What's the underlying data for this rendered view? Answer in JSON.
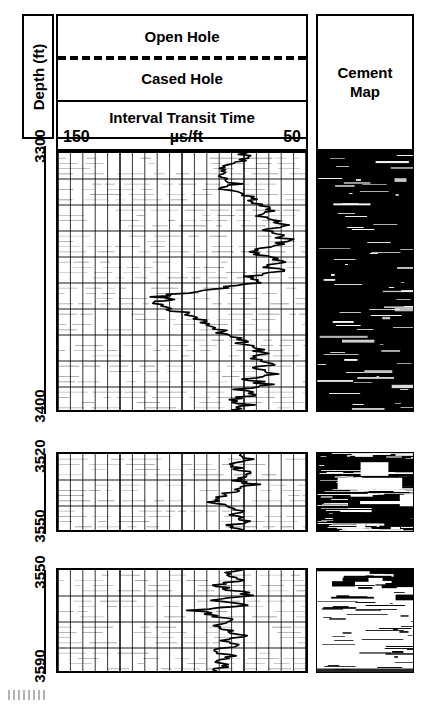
{
  "figure": {
    "type": "well-log",
    "depth_axis_label": "Depth (ft)"
  },
  "header": {
    "open_hole": "Open Hole",
    "cased_hole": "Cased Hole",
    "track_title": "Interval Transit Time",
    "scale_left": "150",
    "scale_unit": "µs/ft",
    "scale_right": "50",
    "cement_map_line1": "Cement",
    "cement_map_line2": "Map"
  },
  "chart_data": {
    "type": "line",
    "title": "Interval Transit Time",
    "xlabel": "µs/ft",
    "ylabel": "Depth (ft)",
    "xlim": [
      150,
      50
    ],
    "grid": true,
    "legend": "none",
    "x_axis_reversed": true,
    "panels": [
      {
        "name": "panel-1",
        "depth_top": 3300,
        "depth_bottom": 3400,
        "depth_ticks": [
          "3300",
          "3400"
        ],
        "series": [
          {
            "name": "Interval Transit Time",
            "points": [
              [
                3300,
                76
              ],
              [
                3302,
                73
              ],
              [
                3304,
                79
              ],
              [
                3306,
                84
              ],
              [
                3308,
                80
              ],
              [
                3310,
                85
              ],
              [
                3312,
                79
              ],
              [
                3314,
                83
              ],
              [
                3316,
                76
              ],
              [
                3318,
                72
              ],
              [
                3320,
                68
              ],
              [
                3322,
                64
              ],
              [
                3324,
                69
              ],
              [
                3326,
                63
              ],
              [
                3328,
                59
              ],
              [
                3330,
                66
              ],
              [
                3332,
                61
              ],
              [
                3334,
                57
              ],
              [
                3336,
                63
              ],
              [
                3338,
                72
              ],
              [
                3340,
                67
              ],
              [
                3342,
                59
              ],
              [
                3344,
                66
              ],
              [
                3346,
                58
              ],
              [
                3348,
                75
              ],
              [
                3350,
                68
              ],
              [
                3352,
                80
              ],
              [
                3354,
                97
              ],
              [
                3356,
                110
              ],
              [
                3357,
                104
              ],
              [
                3358,
                113
              ],
              [
                3360,
                106
              ],
              [
                3362,
                100
              ],
              [
                3364,
                95
              ],
              [
                3366,
                90
              ],
              [
                3368,
                86
              ],
              [
                3370,
                83
              ],
              [
                3372,
                79
              ],
              [
                3374,
                76
              ],
              [
                3376,
                71
              ],
              [
                3378,
                67
              ],
              [
                3380,
                73
              ],
              [
                3382,
                64
              ],
              [
                3384,
                70
              ],
              [
                3386,
                62
              ],
              [
                3388,
                74
              ],
              [
                3390,
                66
              ],
              [
                3392,
                78
              ],
              [
                3394,
                70
              ],
              [
                3396,
                82
              ],
              [
                3398,
                74
              ],
              [
                3400,
                80
              ]
            ]
          }
        ],
        "cement_map": {
          "dominant": "black",
          "description": "Mostly dark (good bond) with scattered thin white horizontal streaks"
        }
      },
      {
        "name": "panel-2",
        "depth_top": 3520,
        "depth_bottom": 3550,
        "depth_ticks": [
          "3520",
          "3550"
        ],
        "series": [
          {
            "name": "Interval Transit Time",
            "points": [
              [
                3520,
                78
              ],
              [
                3522,
                74
              ],
              [
                3524,
                80
              ],
              [
                3526,
                76
              ],
              [
                3528,
                72
              ],
              [
                3530,
                79
              ],
              [
                3532,
                71
              ],
              [
                3534,
                77
              ],
              [
                3536,
                84
              ],
              [
                3538,
                90
              ],
              [
                3540,
                83
              ],
              [
                3542,
                77
              ],
              [
                3544,
                81
              ],
              [
                3546,
                74
              ],
              [
                3548,
                79
              ],
              [
                3550,
                75
              ]
            ]
          }
        ],
        "cement_map": {
          "dominant": "mottled",
          "description": "Heavily mottled black and white (poor/partial bond)"
        }
      },
      {
        "name": "panel-3",
        "depth_top": 3550,
        "depth_bottom": 3590,
        "depth_ticks": [
          "3550",
          "3590"
        ],
        "series": [
          {
            "name": "Interval Transit Time",
            "points": [
              [
                3550,
                77
              ],
              [
                3552,
                83
              ],
              [
                3554,
                75
              ],
              [
                3556,
                86
              ],
              [
                3558,
                79
              ],
              [
                3560,
                72
              ],
              [
                3562,
                85
              ],
              [
                3564,
                76
              ],
              [
                3566,
                95
              ],
              [
                3568,
                88
              ],
              [
                3570,
                80
              ],
              [
                3572,
                90
              ],
              [
                3574,
                82
              ],
              [
                3576,
                76
              ],
              [
                3578,
                84
              ],
              [
                3580,
                78
              ],
              [
                3582,
                86
              ],
              [
                3584,
                79
              ],
              [
                3586,
                88
              ],
              [
                3588,
                81
              ],
              [
                3590,
                86
              ]
            ]
          }
        ],
        "cement_map": {
          "dominant": "white",
          "description": "Mostly light (free pipe) with dark band at top and scattered dark streaks"
        }
      }
    ]
  }
}
